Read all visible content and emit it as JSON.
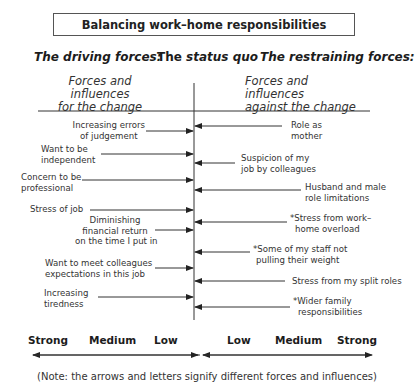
{
  "title": "Balancing work–home responsibilities",
  "headings": {
    "driving": "The driving forces:",
    "status_quo_prefix": "The",
    "status_quo_italic": "status quo",
    "restraining": "The restraining forces:"
  },
  "subheadings": {
    "left_line1": "Forces and influences",
    "left_line2": "for the change",
    "right_line1": "Forces and influences",
    "right_line2": "against the change"
  },
  "driving_forces": [
    {
      "lines": [
        "Increasing errors",
        "of judgement"
      ],
      "arrow_y": 131,
      "arrow_start_x": 146
    },
    {
      "lines": [
        "Want to be",
        "independent"
      ],
      "arrow_y": 154,
      "arrow_start_x": 101
    },
    {
      "lines": [
        "Concern to be",
        "professional"
      ],
      "arrow_y": 180,
      "arrow_start_x": 82
    },
    {
      "lines": [
        "Stress of job"
      ],
      "arrow_y": 210,
      "arrow_start_x": 90
    },
    {
      "lines": [
        "Diminishing",
        "financial return",
        "on the time I put in"
      ],
      "arrow_y": 230,
      "arrow_start_x": 155
    },
    {
      "lines": [
        "Want to meet colleagues",
        "expectations in this job"
      ],
      "arrow_y": 268,
      "arrow_start_x": 155
    },
    {
      "lines": [
        "Increasing",
        "tiredness"
      ],
      "arrow_y": 297,
      "arrow_start_x": 98
    }
  ],
  "restraining_forces": [
    {
      "lines": [
        "Role  as",
        "mother"
      ],
      "arrow_y": 126,
      "arrow_end_x": 282
    },
    {
      "lines": [
        "Suspicion of my",
        "job by colleagues"
      ],
      "arrow_y": 163,
      "arrow_end_x": 235
    },
    {
      "lines": [
        "Husband and male",
        "role limitations"
      ],
      "arrow_y": 190,
      "arrow_end_x": 301
    },
    {
      "lines": [
        "*Stress from work–",
        "home overload"
      ],
      "arrow_y": 222,
      "arrow_end_x": 287
    },
    {
      "lines": [
        "*Some of my staff not",
        "pulling their weight"
      ],
      "arrow_y": 252,
      "arrow_end_x": 250
    },
    {
      "lines": [
        "Stress from my split roles"
      ],
      "arrow_y": 281,
      "arrow_end_x": 285
    },
    {
      "lines": [
        "*Wider family",
        "responsibilities"
      ],
      "arrow_y": 307,
      "arrow_end_x": 290
    }
  ],
  "scale": {
    "left": [
      "Strong",
      "Medium",
      "Low"
    ],
    "right": [
      "Low",
      "Medium",
      "Strong"
    ]
  },
  "note": "(Note: the arrows and letters signify different forces and influences)",
  "colors": {
    "line": "#2a2a2a",
    "text": "#333333"
  }
}
